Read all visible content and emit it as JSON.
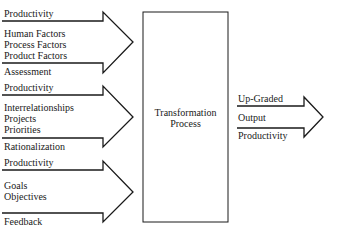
{
  "diagram": {
    "inputs": [
      {
        "top_label": "Productivity",
        "middle_lines": [
          "Human Factors",
          "Process Factors",
          "Product Factors"
        ],
        "bottom_label": "Assessment"
      },
      {
        "top_label": "Productivity",
        "middle_lines": [
          "Interrelationships",
          "Projects",
          "Priorities"
        ],
        "bottom_label": "Rationalization"
      },
      {
        "top_label": "Productivity",
        "middle_lines": [
          "Goals",
          "Objectives"
        ],
        "bottom_label": "Feedback"
      }
    ],
    "process": {
      "line1": "Transformation",
      "line2": "Process"
    },
    "output": {
      "top_label": "Up-Graded",
      "middle_label": "Output",
      "bottom_label": "Productivity"
    },
    "colors": {
      "line": "#1a1a1a",
      "background": "#ffffff"
    }
  }
}
